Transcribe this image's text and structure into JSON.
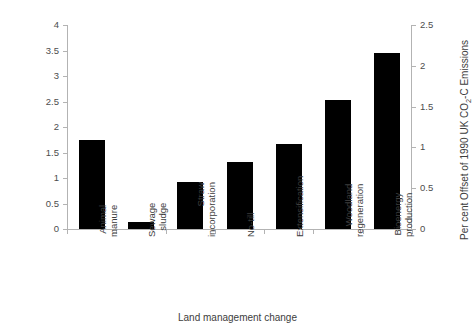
{
  "chart_data": {
    "type": "bar",
    "title": "",
    "xlabel": "Land management change",
    "ylabel": "Maximum yearly C mitigation potential (Tg C yr⁻¹)",
    "ylabel_right": "Per cent Offset of 1990 UK CO₂-C Emissions",
    "categories": [
      "Animal manure",
      "Sewage sludge",
      "Straw incorporation",
      "No-till",
      "Extensification",
      "Woodland regeneration",
      "Bioenergy production"
    ],
    "category_lines": [
      [
        "Animal",
        "manure"
      ],
      [
        "Sewage",
        "sludge"
      ],
      [
        "Straw",
        "incorporation"
      ],
      [
        "No-till",
        ""
      ],
      [
        "Extensification",
        ""
      ],
      [
        "Woodland",
        "regeneration"
      ],
      [
        "Bioenergy",
        "production"
      ]
    ],
    "values": [
      1.75,
      0.13,
      0.92,
      1.32,
      1.66,
      2.53,
      3.46
    ],
    "values_right_axis": [
      1.09,
      0.08,
      0.58,
      0.83,
      1.04,
      1.58,
      2.16
    ],
    "ylim": [
      0,
      4
    ],
    "ylim_right": [
      0,
      2.5
    ],
    "yticks": [
      "0",
      "0.5",
      "1",
      "1.5",
      "2",
      "2.5",
      "3",
      "3.5",
      "4"
    ],
    "ytick_values": [
      0,
      0.5,
      1,
      1.5,
      2,
      2.5,
      3,
      3.5,
      4
    ],
    "yticks_right": [
      "0",
      "0.5",
      "1",
      "1.5",
      "2",
      "2.5"
    ],
    "ytick_values_right": [
      0,
      0.5,
      1,
      1.5,
      2,
      2.5
    ],
    "grid": false,
    "legend": null,
    "bar_color": "#000000",
    "axis_color": "#b3b3b3",
    "text_color": "#3d3d3d"
  }
}
